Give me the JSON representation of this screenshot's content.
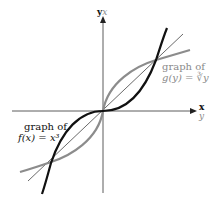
{
  "diagram": {
    "type": "function-and-inverse-graph",
    "axes": {
      "vertical_label_primary": "y",
      "vertical_label_secondary": "x",
      "horizontal_label_primary": "x",
      "horizontal_label_secondary": "y"
    },
    "curves": [
      {
        "name": "f",
        "label_line1": "graph of",
        "label_line2": "f(x) = x³",
        "color": "#111111"
      },
      {
        "name": "g",
        "label_line1": "graph of",
        "label_line2": "g(y) = ∛y",
        "color": "#8c8c8c"
      },
      {
        "name": "identity",
        "color": "#555555"
      }
    ]
  }
}
